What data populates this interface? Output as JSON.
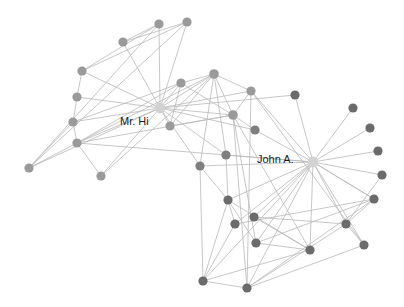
{
  "figure": {
    "background_color": "#ffffff",
    "width": 404,
    "height": 307
  },
  "style": {
    "edge_color": "#b9b9b9",
    "edge_width": 0.8,
    "label_color": "#1c1c1c",
    "label_font_size": 11,
    "node_radius_default": 4.6,
    "node_radius_hub": 5.4,
    "color_hub": "#d2d2d2",
    "color_light": "#9a9a9a",
    "color_dark": "#6b6b6b"
  },
  "chart_data": {
    "type": "scatter",
    "xlabel": "",
    "ylabel": "",
    "grid": false,
    "legend_position": "none",
    "node_count": 34,
    "edge_count": 78,
    "nodes": [
      {
        "id": 0,
        "label": "Mr. Hi",
        "x": 160,
        "y": 108,
        "r": 5.4,
        "color": "#d2d2d2",
        "group": "hub",
        "label_x": 120,
        "label_y": 122,
        "label_anchor": "start"
      },
      {
        "id": 33,
        "label": "John A.",
        "x": 313,
        "y": 162,
        "r": 5.4,
        "color": "#d2d2d2",
        "group": "hub",
        "label_x": 257,
        "label_y": 160,
        "label_anchor": "start"
      },
      {
        "id": 1,
        "label": "",
        "x": 214,
        "y": 74,
        "r": 4.8,
        "color": "#9a9a9a",
        "group": "light"
      },
      {
        "id": 2,
        "label": "",
        "x": 233,
        "y": 115,
        "r": 4.8,
        "color": "#9a9a9a",
        "group": "light"
      },
      {
        "id": 3,
        "label": "",
        "x": 181,
        "y": 83,
        "r": 4.6,
        "color": "#9a9a9a",
        "group": "light"
      },
      {
        "id": 4,
        "label": "",
        "x": 159,
        "y": 24,
        "r": 4.6,
        "color": "#9a9a9a",
        "group": "light"
      },
      {
        "id": 5,
        "label": "",
        "x": 187,
        "y": 22,
        "r": 4.6,
        "color": "#9a9a9a",
        "group": "light"
      },
      {
        "id": 6,
        "label": "",
        "x": 123,
        "y": 42,
        "r": 4.6,
        "color": "#9a9a9a",
        "group": "light"
      },
      {
        "id": 7,
        "label": "",
        "x": 170,
        "y": 126,
        "r": 4.6,
        "color": "#9a9a9a",
        "group": "light"
      },
      {
        "id": 8,
        "label": "",
        "x": 251,
        "y": 91,
        "r": 4.6,
        "color": "#9a9a9a",
        "group": "light"
      },
      {
        "id": 10,
        "label": "",
        "x": 82,
        "y": 71,
        "r": 4.6,
        "color": "#9a9a9a",
        "group": "light"
      },
      {
        "id": 11,
        "label": "",
        "x": 77,
        "y": 97,
        "r": 4.6,
        "color": "#9a9a9a",
        "group": "light"
      },
      {
        "id": 12,
        "label": "",
        "x": 73,
        "y": 122,
        "r": 4.6,
        "color": "#9a9a9a",
        "group": "light"
      },
      {
        "id": 13,
        "label": "",
        "x": 77,
        "y": 143,
        "r": 4.6,
        "color": "#9a9a9a",
        "group": "light"
      },
      {
        "id": 16,
        "label": "",
        "x": 29,
        "y": 168,
        "r": 4.6,
        "color": "#9a9a9a",
        "group": "light"
      },
      {
        "id": 17,
        "label": "",
        "x": 101,
        "y": 176,
        "r": 4.6,
        "color": "#9a9a9a",
        "group": "light"
      },
      {
        "id": 19,
        "label": "",
        "x": 200,
        "y": 166,
        "r": 4.6,
        "color": "#7e7e7e",
        "group": "dark"
      },
      {
        "id": 21,
        "label": "",
        "x": 226,
        "y": 155,
        "r": 4.6,
        "color": "#7e7e7e",
        "group": "dark"
      },
      {
        "id": 9,
        "label": "",
        "x": 255,
        "y": 130,
        "r": 4.6,
        "color": "#7e7e7e",
        "group": "dark"
      },
      {
        "id": 14,
        "label": "",
        "x": 295,
        "y": 95,
        "r": 4.6,
        "color": "#6b6b6b",
        "group": "dark"
      },
      {
        "id": 15,
        "label": "",
        "x": 353,
        "y": 108,
        "r": 4.6,
        "color": "#6b6b6b",
        "group": "dark"
      },
      {
        "id": 18,
        "label": "",
        "x": 370,
        "y": 128,
        "r": 4.6,
        "color": "#6b6b6b",
        "group": "dark"
      },
      {
        "id": 20,
        "label": "",
        "x": 378,
        "y": 151,
        "r": 4.6,
        "color": "#6b6b6b",
        "group": "dark"
      },
      {
        "id": 22,
        "label": "",
        "x": 382,
        "y": 175,
        "r": 4.6,
        "color": "#6b6b6b",
        "group": "dark"
      },
      {
        "id": 23,
        "label": "",
        "x": 374,
        "y": 199,
        "r": 4.6,
        "color": "#6b6b6b",
        "group": "dark"
      },
      {
        "id": 24,
        "label": "",
        "x": 228,
        "y": 200,
        "r": 4.6,
        "color": "#6b6b6b",
        "group": "dark"
      },
      {
        "id": 25,
        "label": "",
        "x": 235,
        "y": 224,
        "r": 4.6,
        "color": "#6b6b6b",
        "group": "dark"
      },
      {
        "id": 26,
        "label": "",
        "x": 254,
        "y": 217,
        "r": 4.6,
        "color": "#6b6b6b",
        "group": "dark"
      },
      {
        "id": 27,
        "label": "",
        "x": 256,
        "y": 243,
        "r": 4.6,
        "color": "#6b6b6b",
        "group": "dark"
      },
      {
        "id": 28,
        "label": "",
        "x": 310,
        "y": 250,
        "r": 4.6,
        "color": "#6b6b6b",
        "group": "dark"
      },
      {
        "id": 29,
        "label": "",
        "x": 346,
        "y": 224,
        "r": 4.6,
        "color": "#6b6b6b",
        "group": "dark"
      },
      {
        "id": 30,
        "label": "",
        "x": 364,
        "y": 245,
        "r": 4.6,
        "color": "#6b6b6b",
        "group": "dark"
      },
      {
        "id": 31,
        "label": "",
        "x": 203,
        "y": 281,
        "r": 4.6,
        "color": "#6b6b6b",
        "group": "dark"
      },
      {
        "id": 32,
        "label": "",
        "x": 247,
        "y": 288,
        "r": 4.6,
        "color": "#6b6b6b",
        "group": "dark"
      }
    ],
    "edges": [
      [
        0,
        1
      ],
      [
        0,
        2
      ],
      [
        0,
        3
      ],
      [
        0,
        4
      ],
      [
        0,
        5
      ],
      [
        0,
        6
      ],
      [
        0,
        7
      ],
      [
        0,
        8
      ],
      [
        0,
        10
      ],
      [
        0,
        11
      ],
      [
        0,
        12
      ],
      [
        0,
        13
      ],
      [
        0,
        17
      ],
      [
        0,
        19
      ],
      [
        0,
        21
      ],
      [
        0,
        9
      ],
      [
        0,
        14
      ],
      [
        0,
        16
      ],
      [
        1,
        2
      ],
      [
        1,
        3
      ],
      [
        1,
        7
      ],
      [
        1,
        13
      ],
      [
        1,
        17
      ],
      [
        1,
        19
      ],
      [
        1,
        21
      ],
      [
        1,
        8
      ],
      [
        2,
        3
      ],
      [
        2,
        7
      ],
      [
        2,
        8
      ],
      [
        2,
        9
      ],
      [
        2,
        13
      ],
      [
        2,
        27
      ],
      [
        2,
        28
      ],
      [
        2,
        32
      ],
      [
        3,
        7
      ],
      [
        3,
        12
      ],
      [
        3,
        13
      ],
      [
        4,
        6
      ],
      [
        4,
        10
      ],
      [
        5,
        6
      ],
      [
        5,
        10
      ],
      [
        5,
        16
      ],
      [
        4,
        16
      ],
      [
        8,
        30
      ],
      [
        8,
        32
      ],
      [
        8,
        33
      ],
      [
        9,
        33
      ],
      [
        13,
        33
      ],
      [
        14,
        33
      ],
      [
        15,
        33
      ],
      [
        18,
        33
      ],
      [
        20,
        33
      ],
      [
        22,
        33
      ],
      [
        23,
        33
      ],
      [
        19,
        33
      ],
      [
        21,
        33
      ],
      [
        11,
        12
      ],
      [
        10,
        11
      ],
      [
        12,
        13
      ],
      [
        13,
        17
      ],
      [
        12,
        16
      ],
      [
        13,
        16
      ],
      [
        23,
        25
      ],
      [
        23,
        27
      ],
      [
        23,
        29
      ],
      [
        23,
        32
      ],
      [
        23,
        33
      ],
      [
        24,
        25
      ],
      [
        24,
        27
      ],
      [
        24,
        31
      ],
      [
        25,
        31
      ],
      [
        26,
        29
      ],
      [
        26,
        33
      ],
      [
        27,
        33
      ],
      [
        28,
        31
      ],
      [
        28,
        33
      ],
      [
        29,
        32
      ],
      [
        29,
        33
      ],
      [
        30,
        32
      ],
      [
        30,
        33
      ],
      [
        31,
        32
      ],
      [
        31,
        33
      ],
      [
        32,
        33
      ],
      [
        24,
        33
      ],
      [
        25,
        33
      ],
      [
        19,
        24
      ],
      [
        21,
        24
      ],
      [
        19,
        31
      ],
      [
        24,
        28
      ],
      [
        26,
        28
      ],
      [
        27,
        28
      ],
      [
        29,
        30
      ],
      [
        22,
        29
      ]
    ],
    "labels": [
      {
        "text": "Mr. Hi",
        "x": 120,
        "y": 122
      },
      {
        "text": "John A.",
        "x": 257,
        "y": 160
      }
    ]
  }
}
